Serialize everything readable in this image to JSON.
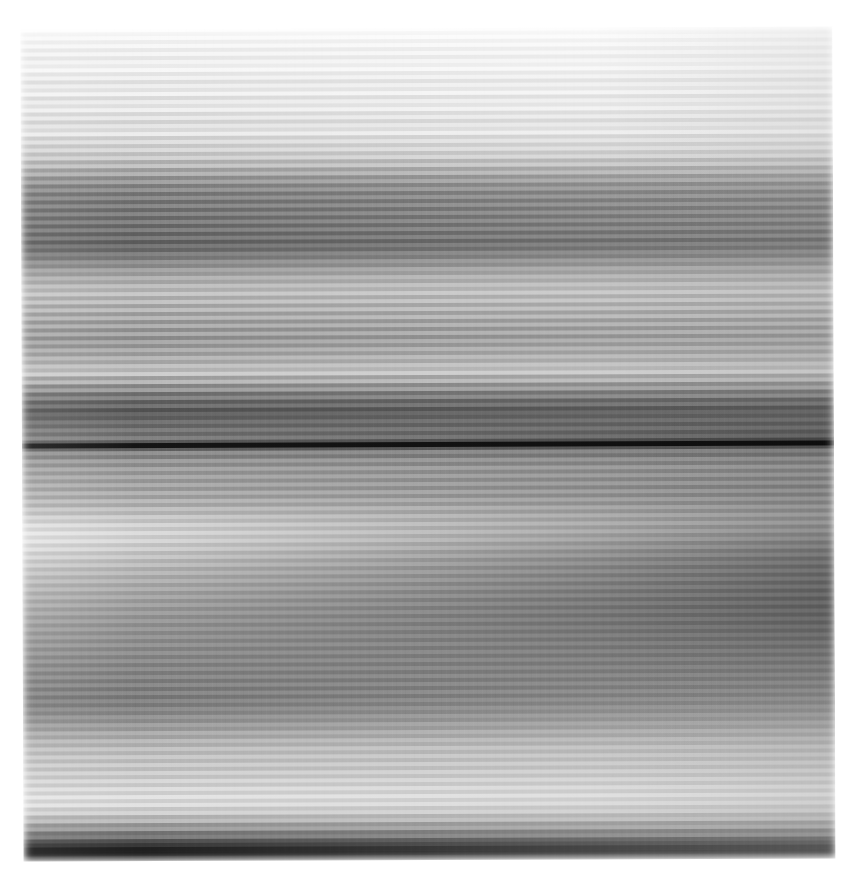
{
  "capture": {
    "title": "Horizontally smeared grayscale capture",
    "width_px": 845,
    "height_px": 882,
    "background_color": "#ffffff",
    "content_left_px": 22,
    "content_top_px": 28,
    "content_width_px": 812,
    "content_height_px": 832,
    "rotation_deg": -0.22,
    "color_mode": "grayscale",
    "artifact": "horizontal-motion-blur"
  },
  "chart_data": {
    "type": "heatmap",
    "title": "Horizontally smeared grayscale capture",
    "subtitle": "Row-wise luminance profile of a motion-blurred screen capture",
    "xlabel": "horizontal position (px)",
    "ylabel": "vertical position (px)",
    "legend_position": "none",
    "grid": false,
    "xlim": [
      0,
      845
    ],
    "ylim": [
      0,
      882
    ],
    "value_range": [
      0,
      255
    ],
    "value_label": "luminance (0 = black, 255 = white)",
    "row_pitch_px": 4,
    "note": "Each row band is rendered as a left-to-right luminance ramp; left and right give the band endpoint luminance values.",
    "columns": [
      "y_px",
      "height_px",
      "left_luma",
      "right_luma"
    ],
    "rows": [
      [
        0,
        5,
        250,
        252
      ],
      [
        5,
        4,
        246,
        250
      ],
      [
        9,
        4,
        252,
        249
      ],
      [
        13,
        4,
        241,
        247
      ],
      [
        17,
        4,
        249,
        252
      ],
      [
        21,
        4,
        236,
        244
      ],
      [
        25,
        4,
        247,
        250
      ],
      [
        29,
        4,
        231,
        241
      ],
      [
        33,
        4,
        245,
        248
      ],
      [
        37,
        4,
        228,
        238
      ],
      [
        41,
        4,
        243,
        247
      ],
      [
        45,
        4,
        233,
        240
      ],
      [
        49,
        4,
        247,
        249
      ],
      [
        53,
        4,
        226,
        236
      ],
      [
        57,
        4,
        241,
        245
      ],
      [
        61,
        4,
        219,
        231
      ],
      [
        65,
        4,
        238,
        243
      ],
      [
        69,
        4,
        224,
        234
      ],
      [
        73,
        4,
        243,
        246
      ],
      [
        77,
        4,
        215,
        228
      ],
      [
        81,
        4,
        236,
        241
      ],
      [
        85,
        4,
        221,
        232
      ],
      [
        89,
        4,
        240,
        244
      ],
      [
        93,
        4,
        212,
        226
      ],
      [
        97,
        4,
        233,
        239
      ],
      [
        101,
        4,
        206,
        221
      ],
      [
        105,
        4,
        229,
        236
      ],
      [
        109,
        4,
        214,
        227
      ],
      [
        113,
        4,
        236,
        241
      ],
      [
        117,
        4,
        201,
        218
      ],
      [
        121,
        4,
        224,
        232
      ],
      [
        125,
        4,
        195,
        213
      ],
      [
        129,
        4,
        218,
        228
      ],
      [
        133,
        4,
        186,
        206
      ],
      [
        137,
        4,
        210,
        221
      ],
      [
        141,
        4,
        168,
        191
      ],
      [
        145,
        4,
        196,
        210
      ],
      [
        149,
        4,
        150,
        176
      ],
      [
        153,
        4,
        178,
        195
      ],
      [
        157,
        4,
        132,
        160
      ],
      [
        161,
        4,
        160,
        180
      ],
      [
        165,
        4,
        118,
        147
      ],
      [
        169,
        4,
        146,
        168
      ],
      [
        173,
        4,
        108,
        138
      ],
      [
        177,
        4,
        138,
        161
      ],
      [
        181,
        4,
        102,
        133
      ],
      [
        185,
        4,
        134,
        157
      ],
      [
        189,
        4,
        99,
        130
      ],
      [
        193,
        4,
        131,
        154
      ],
      [
        197,
        4,
        97,
        128
      ],
      [
        201,
        4,
        129,
        152
      ],
      [
        205,
        4,
        94,
        125
      ],
      [
        209,
        4,
        126,
        149
      ],
      [
        213,
        4,
        90,
        121
      ],
      [
        217,
        4,
        121,
        145
      ],
      [
        221,
        4,
        85,
        116
      ],
      [
        225,
        4,
        116,
        140
      ],
      [
        229,
        4,
        95,
        123
      ],
      [
        233,
        4,
        128,
        149
      ],
      [
        237,
        4,
        112,
        135
      ],
      [
        241,
        4,
        146,
        163
      ],
      [
        245,
        4,
        130,
        149
      ],
      [
        249,
        4,
        165,
        177
      ],
      [
        253,
        4,
        148,
        163
      ],
      [
        257,
        4,
        180,
        189
      ],
      [
        261,
        4,
        160,
        173
      ],
      [
        265,
        4,
        192,
        198
      ],
      [
        269,
        4,
        171,
        182
      ],
      [
        273,
        4,
        200,
        205
      ],
      [
        277,
        4,
        166,
        178
      ],
      [
        281,
        4,
        196,
        202
      ],
      [
        285,
        4,
        158,
        172
      ],
      [
        289,
        4,
        190,
        197
      ],
      [
        293,
        4,
        150,
        166
      ],
      [
        297,
        4,
        183,
        192
      ],
      [
        301,
        4,
        142,
        159
      ],
      [
        305,
        4,
        176,
        186
      ],
      [
        309,
        4,
        137,
        155
      ],
      [
        313,
        4,
        172,
        183
      ],
      [
        317,
        4,
        133,
        152
      ],
      [
        321,
        4,
        169,
        180
      ],
      [
        325,
        4,
        140,
        157
      ],
      [
        329,
        4,
        176,
        185
      ],
      [
        333,
        4,
        149,
        164
      ],
      [
        337,
        4,
        184,
        191
      ],
      [
        341,
        4,
        161,
        173
      ],
      [
        345,
        4,
        195,
        199
      ],
      [
        349,
        4,
        176,
        185
      ],
      [
        353,
        4,
        206,
        208
      ],
      [
        357,
        4,
        154,
        168
      ],
      [
        361,
        4,
        186,
        191
      ],
      [
        365,
        4,
        128,
        146
      ],
      [
        369,
        4,
        160,
        170
      ],
      [
        373,
        4,
        104,
        123
      ],
      [
        377,
        4,
        134,
        146
      ],
      [
        381,
        4,
        88,
        103
      ],
      [
        385,
        4,
        115,
        124
      ],
      [
        389,
        4,
        78,
        90
      ],
      [
        393,
        4,
        103,
        108
      ],
      [
        397,
        4,
        90,
        95
      ],
      [
        401,
        4,
        118,
        114
      ],
      [
        405,
        4,
        100,
        92
      ],
      [
        409,
        4,
        130,
        112
      ],
      [
        413,
        4,
        108,
        88
      ],
      [
        417,
        4,
        136,
        104
      ],
      [
        421,
        3,
        92,
        70
      ],
      [
        424,
        5,
        22,
        14
      ],
      [
        429,
        3,
        96,
        80
      ],
      [
        432,
        4,
        150,
        132
      ],
      [
        436,
        4,
        126,
        112
      ],
      [
        440,
        4,
        164,
        146
      ],
      [
        444,
        4,
        140,
        124
      ],
      [
        448,
        4,
        172,
        153
      ],
      [
        452,
        4,
        148,
        128
      ],
      [
        456,
        4,
        176,
        152
      ],
      [
        460,
        4,
        152,
        126
      ],
      [
        464,
        4,
        180,
        150
      ],
      [
        468,
        4,
        156,
        124
      ],
      [
        472,
        4,
        186,
        150
      ],
      [
        476,
        4,
        162,
        126
      ],
      [
        480,
        4,
        194,
        152
      ],
      [
        484,
        4,
        172,
        130
      ],
      [
        488,
        4,
        204,
        156
      ],
      [
        492,
        4,
        186,
        134
      ],
      [
        496,
        4,
        216,
        158
      ],
      [
        500,
        4,
        200,
        136
      ],
      [
        504,
        4,
        228,
        156
      ],
      [
        508,
        4,
        210,
        132
      ],
      [
        512,
        4,
        234,
        150
      ],
      [
        516,
        4,
        214,
        126
      ],
      [
        520,
        4,
        232,
        142
      ],
      [
        524,
        4,
        208,
        118
      ],
      [
        528,
        4,
        226,
        134
      ],
      [
        532,
        4,
        200,
        110
      ],
      [
        536,
        4,
        218,
        126
      ],
      [
        540,
        4,
        192,
        104
      ],
      [
        544,
        4,
        210,
        120
      ],
      [
        548,
        4,
        184,
        100
      ],
      [
        552,
        4,
        202,
        118
      ],
      [
        556,
        4,
        178,
        98
      ],
      [
        560,
        4,
        196,
        116
      ],
      [
        564,
        4,
        172,
        96
      ],
      [
        568,
        4,
        190,
        114
      ],
      [
        572,
        4,
        166,
        94
      ],
      [
        576,
        4,
        184,
        112
      ],
      [
        580,
        4,
        160,
        92
      ],
      [
        584,
        4,
        178,
        110
      ],
      [
        588,
        4,
        155,
        92
      ],
      [
        592,
        4,
        173,
        110
      ],
      [
        596,
        4,
        150,
        94
      ],
      [
        600,
        4,
        168,
        112
      ],
      [
        604,
        4,
        146,
        96
      ],
      [
        608,
        4,
        164,
        114
      ],
      [
        612,
        4,
        142,
        100
      ],
      [
        616,
        4,
        160,
        118
      ],
      [
        620,
        4,
        138,
        104
      ],
      [
        624,
        4,
        157,
        122
      ],
      [
        628,
        4,
        134,
        108
      ],
      [
        632,
        4,
        153,
        126
      ],
      [
        636,
        4,
        130,
        112
      ],
      [
        640,
        4,
        150,
        130
      ],
      [
        644,
        4,
        126,
        116
      ],
      [
        648,
        4,
        146,
        134
      ],
      [
        652,
        4,
        122,
        120
      ],
      [
        656,
        4,
        143,
        138
      ],
      [
        660,
        4,
        118,
        124
      ],
      [
        664,
        4,
        140,
        142
      ],
      [
        668,
        4,
        114,
        128
      ],
      [
        672,
        4,
        137,
        146
      ],
      [
        676,
        4,
        112,
        132
      ],
      [
        680,
        4,
        135,
        150
      ],
      [
        684,
        4,
        116,
        138
      ],
      [
        688,
        4,
        140,
        156
      ],
      [
        692,
        4,
        124,
        146
      ],
      [
        696,
        4,
        150,
        164
      ],
      [
        700,
        4,
        134,
        154
      ],
      [
        704,
        4,
        162,
        172
      ],
      [
        708,
        4,
        146,
        162
      ],
      [
        712,
        4,
        176,
        182
      ],
      [
        716,
        4,
        158,
        170
      ],
      [
        720,
        4,
        188,
        190
      ],
      [
        724,
        4,
        170,
        178
      ],
      [
        728,
        4,
        198,
        198
      ],
      [
        732,
        4,
        178,
        184
      ],
      [
        736,
        4,
        204,
        202
      ],
      [
        740,
        4,
        182,
        188
      ],
      [
        744,
        4,
        208,
        206
      ],
      [
        748,
        4,
        186,
        192
      ],
      [
        752,
        4,
        212,
        210
      ],
      [
        756,
        4,
        192,
        196
      ],
      [
        760,
        4,
        218,
        214
      ],
      [
        764,
        4,
        198,
        200
      ],
      [
        768,
        4,
        224,
        218
      ],
      [
        772,
        4,
        204,
        204
      ],
      [
        776,
        4,
        230,
        222
      ],
      [
        780,
        4,
        206,
        206
      ],
      [
        784,
        4,
        228,
        218
      ],
      [
        788,
        4,
        196,
        200
      ],
      [
        792,
        4,
        214,
        210
      ],
      [
        796,
        4,
        172,
        186
      ],
      [
        800,
        4,
        190,
        198
      ],
      [
        804,
        4,
        140,
        166
      ],
      [
        808,
        4,
        158,
        180
      ],
      [
        812,
        4,
        106,
        144
      ],
      [
        816,
        4,
        120,
        158
      ],
      [
        820,
        4,
        70,
        122
      ],
      [
        824,
        4,
        46,
        108
      ],
      [
        828,
        5,
        20,
        92
      ],
      [
        833,
        4,
        16,
        86
      ],
      [
        837,
        4,
        34,
        96
      ],
      [
        841,
        4,
        64,
        112
      ],
      [
        845,
        4,
        104,
        134
      ],
      [
        849,
        3,
        150,
        164
      ],
      [
        852,
        4,
        196,
        196
      ]
    ]
  }
}
